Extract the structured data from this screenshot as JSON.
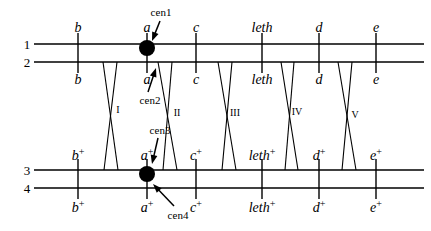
{
  "diagram": {
    "type": "genetic-linkage-crossover-diagram",
    "background": "#ffffff",
    "stroke": "#000000",
    "width": 431,
    "height": 231,
    "row_numbers": [
      {
        "id": "row1",
        "label": "1",
        "x": 27,
        "y": 44
      },
      {
        "id": "row2",
        "label": "2",
        "x": 27,
        "y": 62
      },
      {
        "id": "row3",
        "label": "3",
        "x": 27,
        "y": 170
      },
      {
        "id": "row4",
        "label": "4",
        "x": 27,
        "y": 188
      }
    ],
    "chromosome_lines": [
      {
        "id": "line1",
        "y": 44,
        "x1": 34,
        "x2": 424
      },
      {
        "id": "line2",
        "y": 62,
        "x1": 34,
        "x2": 424
      },
      {
        "id": "line3",
        "y": 170,
        "x1": 34,
        "x2": 424
      },
      {
        "id": "line4",
        "y": 188,
        "x1": 34,
        "x2": 424
      }
    ],
    "loci": [
      {
        "id": "b",
        "x": 78,
        "top_label": "b",
        "bottom_label": "b",
        "sup": ""
      },
      {
        "id": "a",
        "x": 147,
        "top_label": "a",
        "bottom_label": "a",
        "sup": ""
      },
      {
        "id": "c",
        "x": 196,
        "top_label": "c",
        "bottom_label": "c",
        "sup": ""
      },
      {
        "id": "leth",
        "x": 262,
        "top_label": "leth",
        "bottom_label": "leth",
        "sup": ""
      },
      {
        "id": "d",
        "x": 319,
        "top_label": "d",
        "bottom_label": "d",
        "sup": ""
      },
      {
        "id": "e",
        "x": 376,
        "top_label": "e",
        "bottom_label": "e",
        "sup": ""
      }
    ],
    "loci_plus": [
      {
        "id": "bp",
        "x": 78,
        "base": "b",
        "sup": "+"
      },
      {
        "id": "ap",
        "x": 147,
        "base": "a",
        "sup": "+"
      },
      {
        "id": "cp",
        "x": 196,
        "base": "c",
        "sup": "+"
      },
      {
        "id": "lethp",
        "x": 262,
        "base": "leth",
        "sup": "+"
      },
      {
        "id": "dp",
        "x": 319,
        "base": "d",
        "sup": "+"
      },
      {
        "id": "ep",
        "x": 376,
        "base": "e",
        "sup": "+"
      }
    ],
    "upper_top_labels_y": 28,
    "upper_bottom_labels_y": 80,
    "lower_top_labels_y": 155,
    "lower_bottom_labels_y": 207,
    "crossings": [
      {
        "id": "I",
        "label": "I",
        "label_x": 118,
        "label_y": 110,
        "x_top_a": 103,
        "x_top_b": 117,
        "x_bot_a": 118,
        "x_bot_b": 104
      },
      {
        "id": "II",
        "label": "II",
        "label_x": 177,
        "label_y": 113,
        "x_top_a": 158,
        "x_top_b": 172,
        "x_bot_a": 177,
        "x_bot_b": 163
      },
      {
        "id": "III",
        "label": "III",
        "label_x": 235,
        "label_y": 113,
        "x_top_a": 218,
        "x_top_b": 232,
        "x_bot_a": 236,
        "x_bot_b": 222
      },
      {
        "id": "IV",
        "label": "IV",
        "label_x": 297,
        "label_y": 112,
        "x_top_a": 281,
        "x_top_b": 294,
        "x_bot_a": 298,
        "x_bot_b": 285
      },
      {
        "id": "V",
        "label": "V",
        "label_x": 355,
        "label_y": 115,
        "x_top_a": 338,
        "x_top_b": 352,
        "x_bot_a": 356,
        "x_bot_b": 342
      }
    ],
    "centromeres": [
      {
        "id": "cen1",
        "label": "cen1",
        "label_x": 161,
        "label_y": 12,
        "dot_x": 147,
        "dot_y": 48,
        "dot_r": 8,
        "arrow_from_x": 160,
        "arrow_from_y": 21,
        "arrow_to_x": 152,
        "arrow_to_y": 41
      },
      {
        "id": "cen2",
        "label": "cen2",
        "label_x": 150,
        "label_y": 100,
        "dot_x": 147,
        "dot_y": 48,
        "dot_r": 0,
        "arrow_from_x": 148,
        "arrow_from_y": 92,
        "arrow_to_x": 156,
        "arrow_to_y": 68
      },
      {
        "id": "cen3",
        "label": "cen3",
        "label_x": 160,
        "label_y": 130,
        "dot_x": 147,
        "dot_y": 174,
        "dot_r": 0,
        "arrow_from_x": 158,
        "arrow_from_y": 138,
        "arrow_to_x": 152,
        "arrow_to_y": 164
      },
      {
        "id": "cen4",
        "label": "cen4",
        "label_x": 178,
        "label_y": 215,
        "dot_x": 147,
        "dot_y": 174,
        "dot_r": 8,
        "arrow_from_x": 174,
        "arrow_from_y": 206,
        "arrow_to_x": 153,
        "arrow_to_y": 184
      }
    ],
    "centromere_dots": [
      {
        "id": "cen-dot-top",
        "x": 147,
        "y": 48,
        "r": 8
      },
      {
        "id": "cen-dot-bottom",
        "x": 147,
        "y": 174,
        "r": 8
      }
    ]
  }
}
